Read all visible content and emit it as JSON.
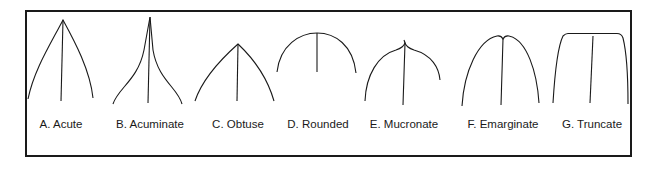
{
  "figure": {
    "items": [
      {
        "id": "A",
        "label": "A. Acute",
        "cx": 61
      },
      {
        "id": "B",
        "label": "B. Acuminate",
        "cx": 148
      },
      {
        "id": "C",
        "label": "C. Obtuse",
        "cx": 238
      },
      {
        "id": "D",
        "label": "D. Rounded",
        "cx": 317
      },
      {
        "id": "E",
        "label": "E. Mucronate",
        "cx": 403
      },
      {
        "id": "F",
        "label": "F. Emarginate",
        "cx": 501
      },
      {
        "id": "G",
        "label": "G. Truncate",
        "cx": 593
      }
    ]
  },
  "colors": {
    "stroke": "#1a1a1a",
    "background": "#ffffff"
  }
}
